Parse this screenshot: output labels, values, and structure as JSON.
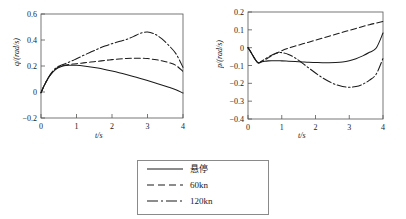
{
  "figure": {
    "background": "#ffffff",
    "axis_color": "#555555",
    "curve_color": "#1a1a1a"
  },
  "legend": {
    "name": "series-legend",
    "entries": [
      {
        "label": "悬停",
        "style": "solid",
        "dash": "none"
      },
      {
        "label": "60kn",
        "style": "dashed",
        "dash": "6,3"
      },
      {
        "label": "120kn",
        "style": "dashdot",
        "dash": "9,2.5,1.6,2.5"
      }
    ]
  },
  "chart_data": [
    {
      "type": "line",
      "id": "q-chart",
      "title": "",
      "xlabel": "t/s",
      "ylabel": "q/(rad/s)",
      "xlim": [
        0,
        4
      ],
      "ylim": [
        -0.2,
        0.6
      ],
      "xticks": [
        0,
        1,
        2,
        3,
        4
      ],
      "yticks": [
        -0.2,
        0,
        0.2,
        0.4,
        0.6
      ],
      "xticklabels": [
        "0",
        "1",
        "2",
        "3",
        "4"
      ],
      "yticklabels": [
        "−0.2",
        "0",
        "0.2",
        "0.4",
        "0.6"
      ],
      "grid": false,
      "legend_position": "below-center",
      "x": [
        0,
        0.1,
        0.2,
        0.3,
        0.4,
        0.5,
        0.6,
        0.7,
        0.8,
        0.9,
        1.0,
        1.2,
        1.4,
        1.6,
        1.8,
        2.0,
        2.2,
        2.4,
        2.6,
        2.8,
        3.0,
        3.2,
        3.4,
        3.6,
        3.8,
        4.0
      ],
      "series": [
        {
          "name": "悬停",
          "style": "solid",
          "values": [
            -0.005,
            0.055,
            0.105,
            0.143,
            0.17,
            0.188,
            0.198,
            0.204,
            0.206,
            0.206,
            0.205,
            0.2,
            0.193,
            0.184,
            0.173,
            0.161,
            0.148,
            0.134,
            0.119,
            0.104,
            0.088,
            0.071,
            0.054,
            0.036,
            0.018,
            -0.008
          ]
        },
        {
          "name": "60kn",
          "style": "dashed",
          "values": [
            -0.005,
            0.055,
            0.105,
            0.145,
            0.175,
            0.192,
            0.202,
            0.208,
            0.212,
            0.215,
            0.218,
            0.224,
            0.23,
            0.236,
            0.243,
            0.249,
            0.254,
            0.258,
            0.26,
            0.26,
            0.257,
            0.25,
            0.24,
            0.226,
            0.205,
            0.158
          ]
        },
        {
          "name": "120kn",
          "style": "dashdot",
          "values": [
            -0.005,
            0.055,
            0.108,
            0.15,
            0.18,
            0.198,
            0.21,
            0.22,
            0.231,
            0.243,
            0.256,
            0.282,
            0.307,
            0.331,
            0.353,
            0.372,
            0.388,
            0.404,
            0.426,
            0.452,
            0.461,
            0.446,
            0.41,
            0.358,
            0.295,
            0.19
          ]
        }
      ]
    },
    {
      "type": "line",
      "id": "p-chart",
      "title": "",
      "xlabel": "t/s",
      "ylabel": "p/(rad/s)",
      "xlim": [
        0,
        4
      ],
      "ylim": [
        -0.4,
        0.2
      ],
      "xticks": [
        0,
        1,
        2,
        3,
        4
      ],
      "yticks": [
        -0.4,
        -0.3,
        -0.2,
        -0.1,
        0,
        0.1,
        0.2
      ],
      "xticklabels": [
        "0",
        "1",
        "2",
        "3",
        "4"
      ],
      "yticklabels": [
        "−0.4",
        "−0.3",
        "−0.2",
        "−0.1",
        "0",
        "0.1",
        "0.2"
      ],
      "grid": false,
      "legend_position": "below-center",
      "x": [
        0,
        0.1,
        0.2,
        0.3,
        0.4,
        0.5,
        0.6,
        0.7,
        0.8,
        0.9,
        1.0,
        1.2,
        1.4,
        1.6,
        1.8,
        2.0,
        2.2,
        2.4,
        2.6,
        2.8,
        3.0,
        3.2,
        3.4,
        3.6,
        3.8,
        4.0
      ],
      "series": [
        {
          "name": "悬停",
          "style": "solid",
          "values": [
            0.0,
            -0.03,
            -0.062,
            -0.085,
            -0.08,
            -0.076,
            -0.074,
            -0.073,
            -0.073,
            -0.073,
            -0.074,
            -0.076,
            -0.078,
            -0.08,
            -0.082,
            -0.083,
            -0.084,
            -0.084,
            -0.083,
            -0.08,
            -0.073,
            -0.062,
            -0.046,
            -0.026,
            -0.002,
            0.082
          ]
        },
        {
          "name": "60kn",
          "style": "dashed",
          "values": [
            0.0,
            -0.03,
            -0.062,
            -0.085,
            -0.078,
            -0.068,
            -0.057,
            -0.046,
            -0.035,
            -0.026,
            -0.017,
            -0.003,
            0.009,
            0.02,
            0.031,
            0.042,
            0.053,
            0.064,
            0.075,
            0.086,
            0.097,
            0.108,
            0.119,
            0.129,
            0.138,
            0.147
          ]
        },
        {
          "name": "120kn",
          "style": "dashdot",
          "values": [
            0.0,
            -0.03,
            -0.062,
            -0.085,
            -0.076,
            -0.064,
            -0.052,
            -0.042,
            -0.034,
            -0.029,
            -0.028,
            -0.038,
            -0.058,
            -0.085,
            -0.114,
            -0.142,
            -0.168,
            -0.19,
            -0.207,
            -0.218,
            -0.222,
            -0.218,
            -0.205,
            -0.182,
            -0.148,
            -0.06
          ]
        }
      ]
    }
  ]
}
